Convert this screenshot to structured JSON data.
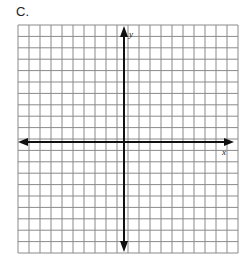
{
  "problem_label": "C.",
  "axes": {
    "x_label": "x",
    "y_label": "y"
  },
  "grid": {
    "columns": 20,
    "rows": 20,
    "line_color": "#8a8a8a",
    "axis_color": "#111111"
  }
}
